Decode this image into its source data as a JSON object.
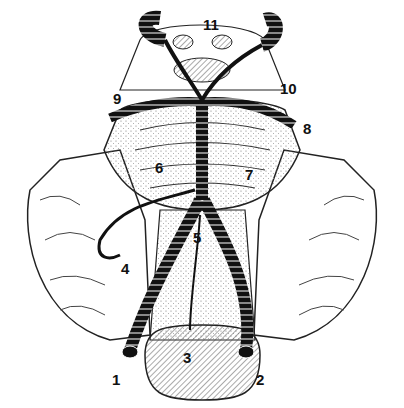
{
  "figure": {
    "type": "anatomical-illustration",
    "labels": [
      {
        "id": "1",
        "text": "1",
        "x": 112,
        "y": 372
      },
      {
        "id": "2",
        "text": "2",
        "x": 256,
        "y": 372
      },
      {
        "id": "3",
        "text": "3",
        "x": 183,
        "y": 350
      },
      {
        "id": "4",
        "text": "4",
        "x": 121,
        "y": 261
      },
      {
        "id": "5",
        "text": "5",
        "x": 193,
        "y": 230
      },
      {
        "id": "6",
        "text": "6",
        "x": 155,
        "y": 160
      },
      {
        "id": "7",
        "text": "7",
        "x": 245,
        "y": 167
      },
      {
        "id": "8",
        "text": "8",
        "x": 303,
        "y": 121
      },
      {
        "id": "9",
        "text": "9",
        "x": 113,
        "y": 91
      },
      {
        "id": "10",
        "text": "10",
        "x": 280,
        "y": 81
      },
      {
        "id": "11",
        "text": "11",
        "x": 203,
        "y": 17
      }
    ]
  }
}
